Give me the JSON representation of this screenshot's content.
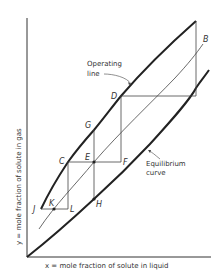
{
  "diagram": {
    "type": "McCabe-Thiele style absorption diagram",
    "x_axis_label": "x = mole fraction of solute in liquid",
    "y_axis_label": "y = mole fraction of solute in gas",
    "operating_line_label_1": "Operating",
    "operating_line_label_2": "line",
    "equilibrium_label_1": "Equilibrium",
    "equilibrium_label_2": "curve",
    "points": {
      "B": "B",
      "C": "C",
      "D": "D",
      "E": "E",
      "F": "F",
      "G": "G",
      "H": "H",
      "J": "J",
      "K": "K",
      "L": "L"
    },
    "colors": {
      "line": "#222222",
      "background": "#ffffff"
    }
  }
}
